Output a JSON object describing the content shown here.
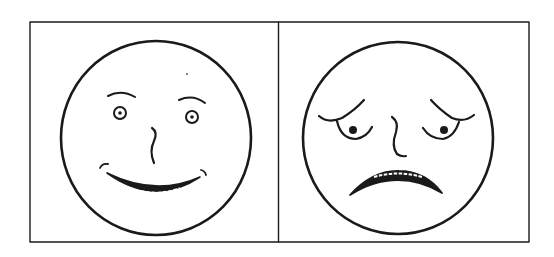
{
  "figure": {
    "panels": [
      {
        "id": "happy",
        "expression": "happy-face"
      },
      {
        "id": "sad",
        "expression": "sad-face"
      }
    ],
    "colors": {
      "ink": "#1a1a1a",
      "background": "#ffffff"
    }
  }
}
